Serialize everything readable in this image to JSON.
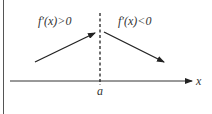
{
  "diagram": {
    "left_label": "f′(x)>0",
    "right_label": "f′(x)<0",
    "axis_label": "x",
    "point_label": "a",
    "colors": {
      "stroke": "#222222",
      "text": "#333333",
      "border": "#444444",
      "background": "#ffffff"
    }
  }
}
